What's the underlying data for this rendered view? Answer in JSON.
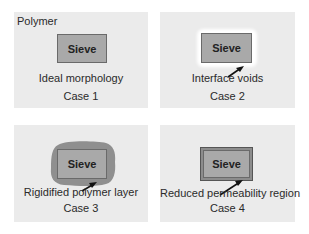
{
  "diagram": {
    "panels": [
      {
        "id": 1,
        "corner_label": "Polymer",
        "sieve_label": "Sieve",
        "description": "Ideal morphology",
        "case": "Case 1"
      },
      {
        "id": 2,
        "sieve_label": "Sieve",
        "description": "Interface voids",
        "case": "Case 2"
      },
      {
        "id": 3,
        "sieve_label": "Sieve",
        "description": "Rigidified polymer layer",
        "case": "Case 3"
      },
      {
        "id": 4,
        "sieve_label": "Sieve",
        "description": "Reduced permeability region",
        "case": "Case 4"
      }
    ],
    "colors": {
      "panel_background": "#ebebeb",
      "sieve_fill": "#a9a9a9",
      "sieve_border": "#6a6a6a",
      "rigid_layer": "#8f8f8f",
      "void": "#ffffff"
    }
  }
}
